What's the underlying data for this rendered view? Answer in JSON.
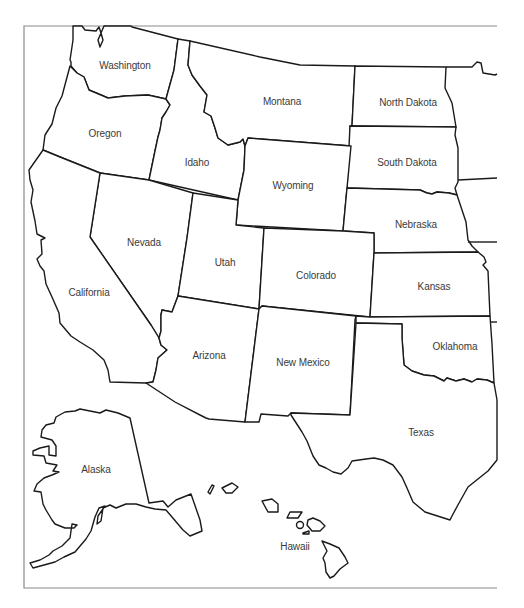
{
  "map": {
    "title": "Western United States",
    "frame_color": "#8a8a8a",
    "line_color": "#1a1a1a",
    "label_color": "#3a3a3a",
    "states": [
      {
        "id": "washington",
        "label": "Washington",
        "x": 125,
        "y": 65
      },
      {
        "id": "oregon",
        "label": "Oregon",
        "x": 105,
        "y": 133
      },
      {
        "id": "idaho",
        "label": "Idaho",
        "x": 197,
        "y": 162
      },
      {
        "id": "montana",
        "label": "Montana",
        "x": 282,
        "y": 101
      },
      {
        "id": "north-dakota",
        "label": "North Dakota",
        "x": 408,
        "y": 102
      },
      {
        "id": "south-dakota",
        "label": "South Dakota",
        "x": 407,
        "y": 162
      },
      {
        "id": "wyoming",
        "label": "Wyoming",
        "x": 293,
        "y": 185
      },
      {
        "id": "nebraska",
        "label": "Nebraska",
        "x": 416,
        "y": 224
      },
      {
        "id": "nevada",
        "label": "Nevada",
        "x": 144,
        "y": 242
      },
      {
        "id": "utah",
        "label": "Utah",
        "x": 225,
        "y": 262
      },
      {
        "id": "colorado",
        "label": "Colorado",
        "x": 316,
        "y": 275
      },
      {
        "id": "kansas",
        "label": "Kansas",
        "x": 434,
        "y": 286
      },
      {
        "id": "california",
        "label": "California",
        "x": 89,
        "y": 292
      },
      {
        "id": "arizona",
        "label": "Arizona",
        "x": 209,
        "y": 355
      },
      {
        "id": "new-mexico",
        "label": "New Mexico",
        "x": 303,
        "y": 362
      },
      {
        "id": "oklahoma",
        "label": "Oklahoma",
        "x": 455,
        "y": 346
      },
      {
        "id": "texas",
        "label": "Texas",
        "x": 421,
        "y": 432
      },
      {
        "id": "alaska",
        "label": "Alaska",
        "x": 96,
        "y": 469
      },
      {
        "id": "hawaii",
        "label": "Hawaii",
        "x": 295,
        "y": 546
      }
    ]
  }
}
